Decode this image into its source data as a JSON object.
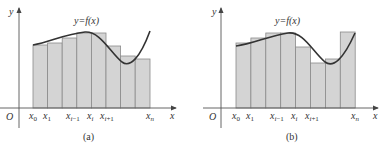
{
  "panels": [
    {
      "id": "a",
      "caption": "(a)",
      "function_label": "y=f(x)",
      "axis_labels": {
        "y": "y",
        "x": "x",
        "origin": "O"
      },
      "tick_labels": [
        "x0",
        "x1",
        "xi-1",
        "xi",
        "xi+1",
        "xn"
      ],
      "description": "Lower Riemann sum: rectangles lie under the curve"
    },
    {
      "id": "b",
      "caption": "(b)",
      "function_label": "y=f(x)",
      "axis_labels": {
        "y": "y",
        "x": "x",
        "origin": "O"
      },
      "tick_labels": [
        "x0",
        "x1",
        "xi-1",
        "xi",
        "xi+1",
        "xn"
      ],
      "description": "Upper Riemann sum: rectangles reach above the curve"
    }
  ],
  "colors": {
    "bar_fill": "#d4d4d4",
    "bar_stroke": "#8a8a8a",
    "curve": "#333333",
    "axis": "#555555"
  }
}
